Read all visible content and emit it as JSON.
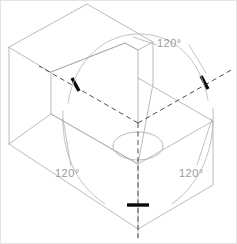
{
  "drawing": {
    "title": "Isometric axes 120 degree angle illustration",
    "type": "technical-drawing",
    "projection": "isometric",
    "background_color": "#ffffff",
    "solid_edge_color": "#a8a8ae",
    "axis_line_color": "#3a3a3a",
    "arc_color": "#b0b0b0",
    "tick_color": "#000000",
    "label_color": "#9a9a9a",
    "object_description": "Stepped (L-shaped) rectangular block shown in isometric projection with a circular through hole in the lower horizontal top face",
    "annotations": [
      {
        "id": "angle-top",
        "label": "120°",
        "between_axes": [
          "left-receding-axis",
          "right-receding-axis"
        ],
        "leader": true
      },
      {
        "id": "angle-left",
        "label": "120°",
        "between_axes": [
          "left-receding-axis",
          "vertical-axis"
        ],
        "leader": true
      },
      {
        "id": "angle-right",
        "label": "120°",
        "between_axes": [
          "vertical-axis",
          "right-receding-axis"
        ],
        "leader": true
      }
    ],
    "axes": [
      {
        "id": "left-receding-axis",
        "from": [
          137,
          122
        ],
        "to": [
          38,
          65
        ],
        "style": "dashed",
        "tick": [
          75,
          84
        ]
      },
      {
        "id": "right-receding-axis",
        "from": [
          137,
          122
        ],
        "to": [
          232,
          68
        ],
        "style": "dashed",
        "tick": [
          204,
          82
        ]
      },
      {
        "id": "vertical-axis",
        "from": [
          137,
          122
        ],
        "to": [
          137,
          237
        ],
        "style": "dashed",
        "tick": [
          137,
          204
        ]
      }
    ],
    "hole": {
      "id": "center-hole",
      "center": [
        137,
        145
      ],
      "rx": 25,
      "ry": 14,
      "style": "ellipse-isometric-circle"
    }
  },
  "labels": {
    "angle_top": "120°",
    "angle_left": "120°",
    "angle_right": "120°"
  }
}
